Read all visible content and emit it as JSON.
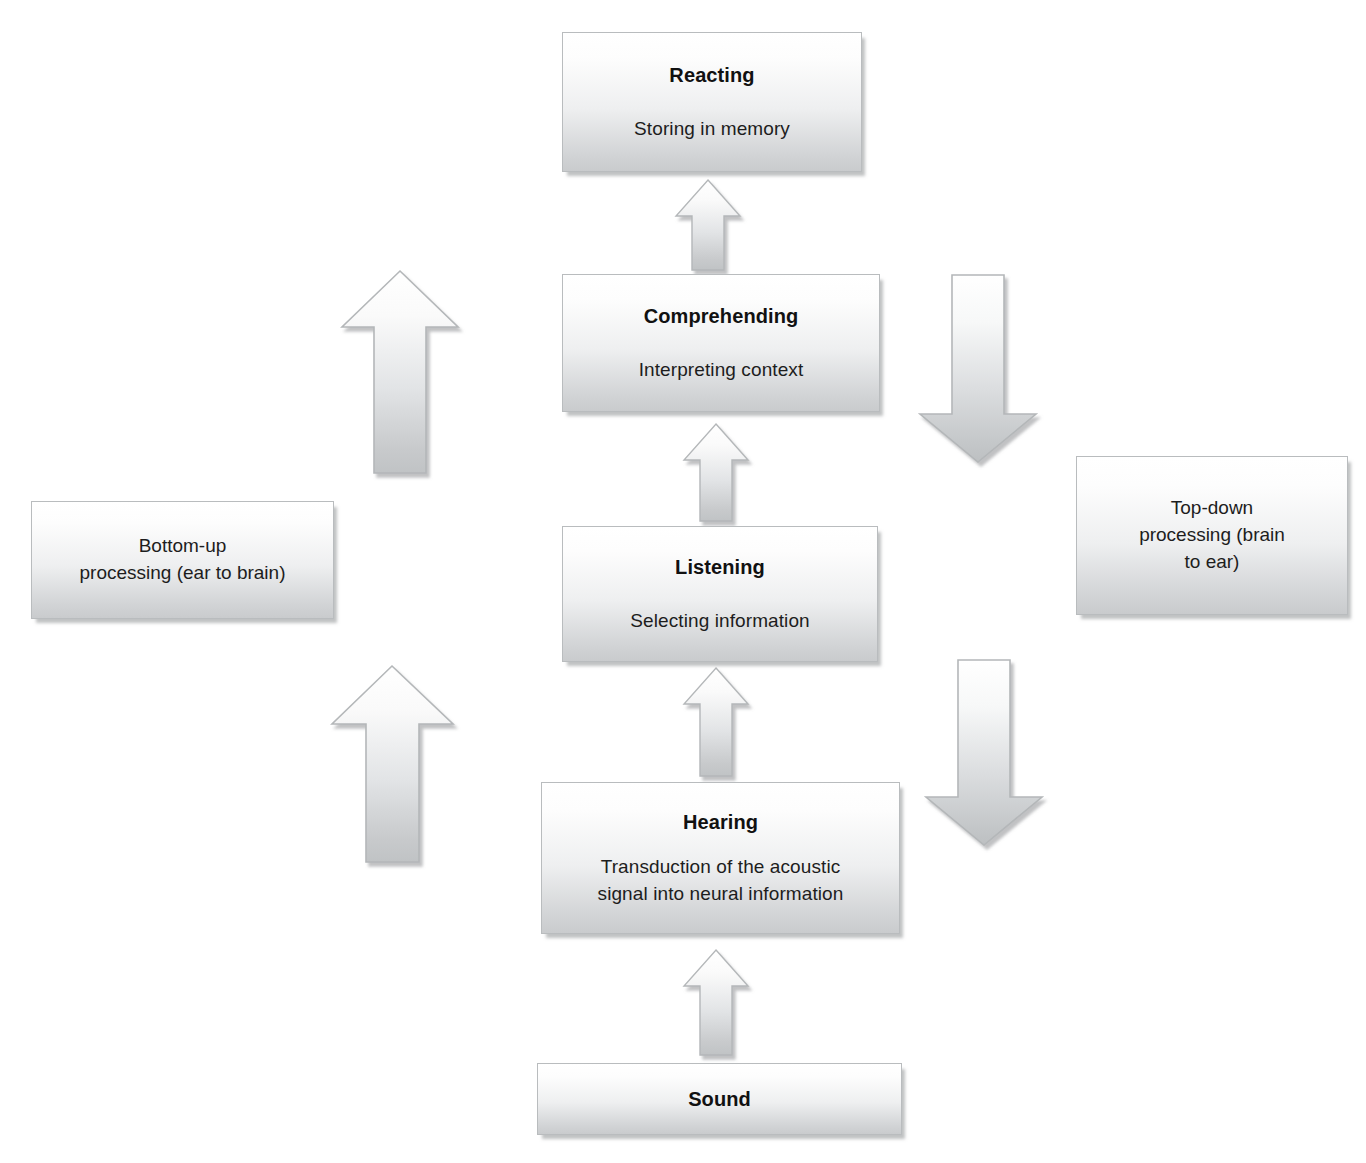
{
  "diagram": {
    "boxes": {
      "reacting": {
        "title": "Reacting",
        "subtitle": "Storing in memory"
      },
      "comprehending": {
        "title": "Comprehending",
        "subtitle": "Interpreting context"
      },
      "listening": {
        "title": "Listening",
        "subtitle": "Selecting information"
      },
      "hearing": {
        "title": "Hearing",
        "subtitle_line1": "Transduction of the acoustic",
        "subtitle_line2": "signal into neural information"
      },
      "sound": {
        "title": "Sound"
      },
      "bottom_up": {
        "line1": "Bottom-up",
        "line2": "processing (ear to brain)"
      },
      "top_down": {
        "line1": "Top-down",
        "line2": "processing (brain",
        "line3": "to ear)"
      }
    },
    "arrows": [
      {
        "name": "arrow-sound-to-hearing",
        "direction": "up",
        "size": "small"
      },
      {
        "name": "arrow-hearing-to-listening",
        "direction": "up",
        "size": "small"
      },
      {
        "name": "arrow-listening-to-comprehending",
        "direction": "up",
        "size": "small"
      },
      {
        "name": "arrow-comprehending-to-reacting",
        "direction": "up",
        "size": "small"
      },
      {
        "name": "arrow-bottom-up-lower",
        "direction": "up",
        "size": "large"
      },
      {
        "name": "arrow-bottom-up-upper",
        "direction": "up",
        "size": "large"
      },
      {
        "name": "arrow-top-down-upper",
        "direction": "down",
        "size": "large"
      },
      {
        "name": "arrow-top-down-lower",
        "direction": "down",
        "size": "large"
      }
    ],
    "colors": {
      "box_fill_top": "#ffffff",
      "box_fill_bottom": "#c9cbcd",
      "box_border": "#b9bcbe",
      "arrow_fill_top": "#fbfbfb",
      "arrow_fill_bottom": "#c3c6c8",
      "arrow_border": "#b4b7b9",
      "shadow": "#8c8f92",
      "text": "#1a1a1a",
      "background": "#ffffff"
    }
  }
}
